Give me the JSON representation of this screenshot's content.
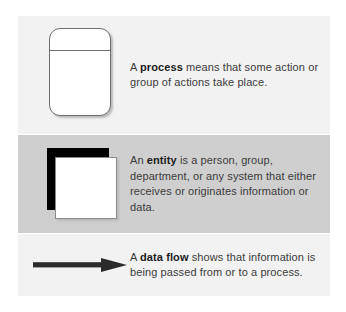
{
  "figure": {
    "background_color": "#ffffff",
    "band_light_color": "#f2f2f2",
    "band_gray_color": "#cfcfcf",
    "text_color": "#3b3b3b"
  },
  "rows": [
    {
      "id": "process",
      "symbol_name": "process-symbol",
      "symbol_description": "rounded rectangle with horizontal divider near top",
      "band_color": "#f2f2f2",
      "text": {
        "lead": "A ",
        "term": "process",
        "rest": " means that some action or group of actions take place.",
        "full": "A process means that some action or group of actions take place."
      }
    },
    {
      "id": "entity",
      "symbol_name": "entity-symbol",
      "symbol_description": "white square with solid black square offset behind it",
      "band_color": "#cfcfcf",
      "text": {
        "lead": "An ",
        "term": "entity",
        "rest": " is a person, group, department, or any system that either receives or originates information or data.",
        "full": "An entity is a person, group, department, or any system that either receives or originates information or data."
      }
    },
    {
      "id": "data-flow",
      "symbol_name": "data-flow-arrow",
      "symbol_description": "thick horizontal arrow pointing right",
      "band_color": "#f2f2f2",
      "text": {
        "lead": "A ",
        "term": "data flow",
        "rest": " shows that information is being passed from or to a process.",
        "full": "A data flow shows that information is being passed from or to a process."
      }
    }
  ]
}
